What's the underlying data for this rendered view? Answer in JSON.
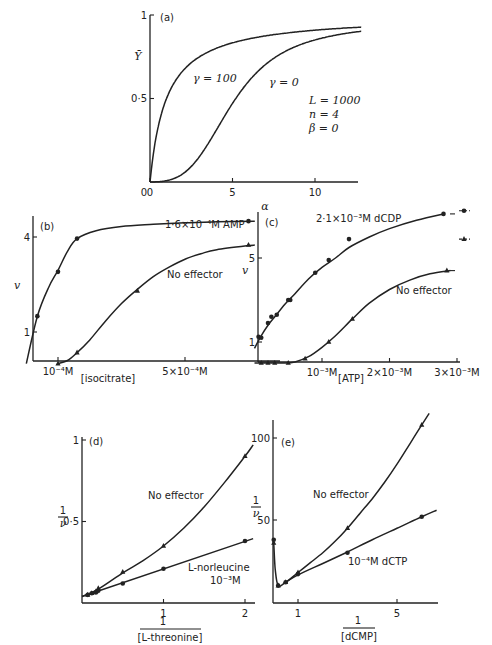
{
  "chart_data": [
    {
      "id": "a",
      "panel_label": "(a)",
      "type": "line",
      "xlabel": "α",
      "ylabel": "Ȳ",
      "xlim": [
        0,
        12.8
      ],
      "ylim": [
        0,
        1
      ],
      "xticks": [
        {
          "v": 0,
          "label": "0"
        },
        {
          "v": 5,
          "label": "5"
        },
        {
          "v": 10,
          "label": "10"
        }
      ],
      "yticks": [
        {
          "v": 0.5,
          "label": "0·5"
        },
        {
          "v": 1,
          "label": "1"
        }
      ],
      "params_text": [
        "L = 1000",
        "n = 4",
        "β = 0"
      ],
      "series": [
        {
          "name": "γ = 100",
          "gamma": 100,
          "L": 1000,
          "n": 4
        },
        {
          "name": "γ = 0",
          "gamma": 0,
          "L": 1000,
          "n": 4
        }
      ]
    },
    {
      "id": "b",
      "panel_label": "(b)",
      "type": "line",
      "xlabel": "[isocitrate]",
      "ylabel": "v",
      "xlim": [
        0,
        7.2
      ],
      "ylim": [
        0,
        4.9
      ],
      "xticks": [
        {
          "v": 1,
          "label": "10⁻⁴M"
        },
        {
          "v": 5,
          "label": "5×10⁻⁴M"
        }
      ],
      "yticks": [
        {
          "v": 1,
          "label": "1"
        },
        {
          "v": 4,
          "label": "4"
        }
      ],
      "series": [
        {
          "name": "1·6×10⁻⁴M AMP",
          "marker": "circle",
          "x": [
            0.35,
            1.0,
            1.6,
            7.0
          ],
          "y": [
            1.5,
            2.9,
            3.95,
            4.5
          ],
          "curve": [
            [
              0,
              0
            ],
            [
              0.35,
              1.5
            ],
            [
              0.7,
              2.4
            ],
            [
              1.0,
              2.95
            ],
            [
              1.3,
              3.55
            ],
            [
              1.6,
              3.95
            ],
            [
              2.2,
              4.2
            ],
            [
              3,
              4.33
            ],
            [
              4,
              4.4
            ],
            [
              5,
              4.45
            ],
            [
              6,
              4.48
            ],
            [
              7.2,
              4.5
            ]
          ]
        },
        {
          "name": "No effector",
          "marker": "triangle",
          "x": [
            1.0,
            1.6,
            3.5,
            7.0
          ],
          "y": [
            0,
            0.35,
            2.3,
            3.75
          ],
          "curve": [
            [
              1.0,
              0
            ],
            [
              1.3,
              0.1
            ],
            [
              1.6,
              0.35
            ],
            [
              2.0,
              0.75
            ],
            [
              2.5,
              1.35
            ],
            [
              3.0,
              1.9
            ],
            [
              3.5,
              2.35
            ],
            [
              4,
              2.75
            ],
            [
              4.5,
              3.05
            ],
            [
              5,
              3.3
            ],
            [
              5.5,
              3.47
            ],
            [
              6,
              3.6
            ],
            [
              7.2,
              3.75
            ]
          ]
        }
      ]
    },
    {
      "id": "c",
      "panel_label": "(c)",
      "type": "line",
      "xlabel": "[ATP]",
      "ylabel": "v",
      "xlim": [
        0,
        3.1
      ],
      "ylim": [
        0,
        7.4
      ],
      "xticks": [
        {
          "v": 1,
          "label": "10⁻³M"
        },
        {
          "v": 2,
          "label": "2×10⁻³M"
        },
        {
          "v": 3,
          "label": "3×10⁻³M"
        }
      ],
      "yticks": [
        {
          "v": 1,
          "label": "1"
        },
        {
          "v": 5,
          "label": "5"
        }
      ],
      "series": [
        {
          "name": "2·1×10⁻³M dCDP",
          "marker": "circle",
          "x": [
            0.06,
            0.1,
            0.2,
            0.25,
            0.33,
            0.5,
            0.53,
            0.9,
            1.1,
            1.4,
            2.8
          ],
          "y": [
            1.25,
            1.2,
            1.9,
            2.2,
            2.3,
            3.0,
            3.0,
            4.3,
            4.9,
            5.9,
            7.1
          ],
          "curve": [
            [
              0,
              0.7
            ],
            [
              0.1,
              1.3
            ],
            [
              0.2,
              1.8
            ],
            [
              0.3,
              2.2
            ],
            [
              0.45,
              2.8
            ],
            [
              0.6,
              3.3
            ],
            [
              0.8,
              4.0
            ],
            [
              1.0,
              4.55
            ],
            [
              1.2,
              5.0
            ],
            [
              1.4,
              5.5
            ],
            [
              1.7,
              6.0
            ],
            [
              2.0,
              6.4
            ],
            [
              2.4,
              6.8
            ],
            [
              2.8,
              7.1
            ]
          ]
        },
        {
          "name": "No effector",
          "marker": "triangle",
          "x": [
            0.1,
            0.2,
            0.3,
            0.5,
            0.75,
            1.1,
            1.45,
            2.85
          ],
          "y": [
            0,
            0,
            0,
            0,
            0.2,
            1.0,
            2.1,
            4.4
          ],
          "curve": [
            [
              0,
              0
            ],
            [
              0.4,
              0
            ],
            [
              0.6,
              0.05
            ],
            [
              0.8,
              0.3
            ],
            [
              1.0,
              0.75
            ],
            [
              1.2,
              1.3
            ],
            [
              1.45,
              2.1
            ],
            [
              1.7,
              2.85
            ],
            [
              2.0,
              3.5
            ],
            [
              2.3,
              3.95
            ],
            [
              2.6,
              4.25
            ],
            [
              2.9,
              4.4
            ]
          ]
        }
      ],
      "offscale_markers": [
        {
          "marker": "circle",
          "y": 7.25
        },
        {
          "marker": "triangle",
          "y": 5.9
        }
      ]
    },
    {
      "id": "d",
      "panel_label": "(d)",
      "type": "line",
      "xlabel": "1 / [L-threonine]",
      "ylabel": "1/v",
      "xlim": [
        0,
        2.1
      ],
      "ylim": [
        0,
        1
      ],
      "xticks": [
        {
          "v": 1,
          "label": "1"
        },
        {
          "v": 2,
          "label": "2"
        }
      ],
      "yticks": [
        {
          "v": 0.5,
          "label": "0·5"
        },
        {
          "v": 1,
          "label": "1"
        }
      ],
      "series": [
        {
          "name": "No effector",
          "marker": "triangle",
          "x": [
            0.07,
            0.12,
            0.17,
            0.2,
            0.5,
            1.0,
            2.0
          ],
          "y": [
            0.05,
            0.06,
            0.07,
            0.09,
            0.19,
            0.35,
            0.9
          ],
          "curve": [
            [
              0,
              0.04
            ],
            [
              0.2,
              0.085
            ],
            [
              0.5,
              0.185
            ],
            [
              0.75,
              0.26
            ],
            [
              1.0,
              0.35
            ],
            [
              1.25,
              0.46
            ],
            [
              1.5,
              0.59
            ],
            [
              1.75,
              0.74
            ],
            [
              2.0,
              0.9
            ],
            [
              2.1,
              0.97
            ]
          ]
        },
        {
          "name": "L-norleucine 10⁻³M",
          "marker": "circle",
          "x": [
            0.07,
            0.12,
            0.17,
            0.2,
            0.5,
            1.0,
            2.0
          ],
          "y": [
            0.05,
            0.06,
            0.065,
            0.075,
            0.12,
            0.21,
            0.38
          ],
          "curve": [
            [
              0,
              0.04
            ],
            [
              2.1,
              0.395
            ]
          ]
        }
      ]
    },
    {
      "id": "e",
      "panel_label": "(e)",
      "type": "line",
      "xlabel": "1 / [dCMP]",
      "ylabel": "1/v",
      "xlim": [
        0,
        6.5
      ],
      "ylim": [
        0,
        110
      ],
      "xticks": [
        {
          "v": 1,
          "label": "1"
        },
        {
          "v": 5,
          "label": "5"
        }
      ],
      "yticks": [
        {
          "v": 50,
          "label": "50"
        },
        {
          "v": 100,
          "label": "100"
        }
      ],
      "series": [
        {
          "name": "No effector",
          "marker": "triangle",
          "x": [
            0.02,
            0.2,
            0.5,
            1.0,
            3.0,
            6.0
          ],
          "y": [
            36,
            10,
            12,
            18,
            45,
            108
          ],
          "curve": [
            [
              0.0,
              38
            ],
            [
              0.02,
              36
            ],
            [
              0.08,
              20
            ],
            [
              0.2,
              10
            ],
            [
              0.5,
              12
            ],
            [
              1.0,
              18
            ],
            [
              1.5,
              24
            ],
            [
              2.0,
              30
            ],
            [
              2.5,
              37
            ],
            [
              3.0,
              45
            ],
            [
              3.5,
              54
            ],
            [
              4.0,
              63
            ],
            [
              4.5,
              73
            ],
            [
              5.0,
              84
            ],
            [
              5.5,
              96
            ],
            [
              6.0,
              108
            ],
            [
              6.3,
              115
            ]
          ]
        },
        {
          "name": "10⁻⁴M dCTP",
          "marker": "circle",
          "x": [
            0.02,
            0.2,
            0.5,
            1.0,
            3.0,
            6.0
          ],
          "y": [
            38,
            10,
            12,
            17,
            30,
            52
          ],
          "curve": [
            [
              0.5,
              12
            ],
            [
              1.0,
              16.5
            ],
            [
              2.0,
              23.5
            ],
            [
              3.0,
              30.5
            ],
            [
              4.0,
              38
            ],
            [
              5.0,
              45
            ],
            [
              6.0,
              52
            ],
            [
              6.6,
              56
            ]
          ]
        }
      ]
    }
  ]
}
